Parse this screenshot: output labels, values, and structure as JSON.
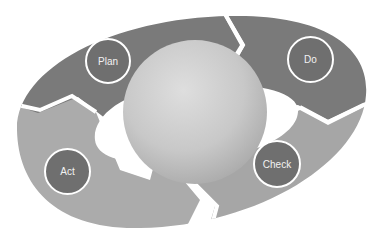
{
  "diagram": {
    "type": "cycle",
    "center": {
      "shape": "sphere"
    },
    "stages": [
      {
        "label": "Plan",
        "order": 1
      },
      {
        "label": "Do",
        "order": 2
      },
      {
        "label": "Check",
        "order": 3
      },
      {
        "label": "Act",
        "order": 4
      }
    ]
  },
  "colors": {
    "background": "#ffffff",
    "arrow_dark": "#7a7a7a",
    "arrow_light": "#ababab",
    "badge_fill": "#6f6f6f",
    "badge_border": "#ffffff",
    "badge_text": "#f2f2f2"
  }
}
